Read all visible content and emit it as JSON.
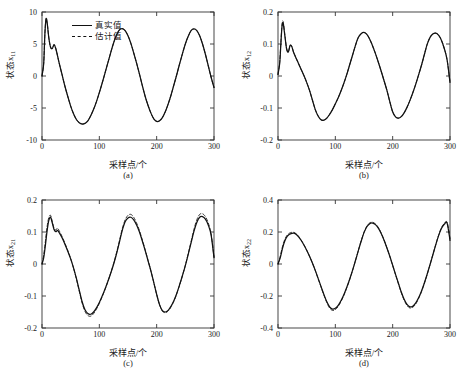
{
  "figure": {
    "background": "#ffffff",
    "line_color": "#111111"
  },
  "legend": {
    "position": "top-left of panel (a)",
    "entries": [
      {
        "label": "真实值",
        "style": "solid"
      },
      {
        "label": "估计值",
        "style": "dashed"
      }
    ]
  },
  "panels": [
    {
      "id": "a",
      "caption": "(a)",
      "ylabel_main": "状态x",
      "ylabel_sub": "11",
      "xlabel": "采样点/个",
      "yticks": [
        "10",
        "5",
        "0",
        "-5",
        "-10"
      ],
      "xticks": [
        "0",
        "100",
        "200",
        "300"
      ]
    },
    {
      "id": "b",
      "caption": "(b)",
      "ylabel_main": "状态x",
      "ylabel_sub": "12",
      "xlabel": "采样点/个",
      "yticks": [
        "0.2",
        "0.1",
        "0",
        "-0.1",
        "-0.2"
      ],
      "xticks": [
        "0",
        "100",
        "200",
        "300"
      ]
    },
    {
      "id": "c",
      "caption": "(c)",
      "ylabel_main": "状态x",
      "ylabel_sub": "21",
      "xlabel": "采样点/个",
      "yticks": [
        "0.2",
        "0.1",
        "0",
        "-0.1",
        "-0.2"
      ],
      "xticks": [
        "0",
        "100",
        "200",
        "300"
      ]
    },
    {
      "id": "d",
      "caption": "(d)",
      "ylabel_main": "状态x",
      "ylabel_sub": "22",
      "xlabel": "采样点/个",
      "yticks": [
        "0.4",
        "0.2",
        "0",
        "-0.2",
        "-0.4"
      ],
      "xticks": [
        "0",
        "100",
        "200",
        "300"
      ]
    }
  ],
  "chart_data": [
    {
      "type": "line",
      "panel": "a",
      "title": "",
      "xlabel": "采样点/个",
      "ylabel": "状态x11",
      "xlim": [
        0,
        300
      ],
      "ylim": [
        -10,
        10
      ],
      "grid": false,
      "legend": [
        "真实值",
        "估计值"
      ],
      "x": [
        0,
        3,
        5,
        7,
        9,
        12,
        15,
        18,
        21,
        24,
        27,
        30,
        35,
        40,
        45,
        50,
        55,
        60,
        65,
        70,
        75,
        80,
        85,
        90,
        95,
        100,
        105,
        110,
        115,
        120,
        125,
        130,
        135,
        140,
        145,
        150,
        155,
        160,
        165,
        170,
        175,
        180,
        185,
        190,
        195,
        200,
        205,
        210,
        215,
        220,
        225,
        230,
        235,
        240,
        245,
        250,
        255,
        260,
        265,
        270,
        275,
        280,
        285,
        290,
        295,
        300
      ],
      "series": [
        {
          "name": "真实值",
          "style": "solid",
          "values": [
            0.0,
            2.0,
            6.5,
            8.9,
            8.3,
            5.9,
            4.5,
            4.3,
            4.9,
            4.3,
            3.2,
            2.0,
            0.2,
            -1.6,
            -3.2,
            -4.7,
            -5.9,
            -6.8,
            -7.3,
            -7.5,
            -7.4,
            -7.0,
            -6.2,
            -5.2,
            -4.0,
            -2.6,
            -1.1,
            0.5,
            2.1,
            3.7,
            5.2,
            6.4,
            7.2,
            7.4,
            7.1,
            6.3,
            5.1,
            3.6,
            2.0,
            0.3,
            -1.5,
            -3.2,
            -4.6,
            -5.8,
            -6.7,
            -7.1,
            -7.0,
            -6.5,
            -5.6,
            -4.4,
            -3.0,
            -1.4,
            0.2,
            1.9,
            3.5,
            5.0,
            6.2,
            7.1,
            7.35,
            7.1,
            6.3,
            5.0,
            3.4,
            1.6,
            -0.2,
            -1.8
          ]
        },
        {
          "name": "估计值",
          "style": "dashed",
          "values": [
            0.0,
            2.1,
            6.6,
            8.9,
            8.3,
            5.9,
            4.5,
            4.3,
            4.9,
            4.3,
            3.2,
            2.0,
            0.2,
            -1.6,
            -3.2,
            -4.7,
            -5.9,
            -6.8,
            -7.3,
            -7.5,
            -7.4,
            -7.0,
            -6.2,
            -5.2,
            -4.0,
            -2.6,
            -1.1,
            0.5,
            2.1,
            3.7,
            5.2,
            6.4,
            7.2,
            7.4,
            7.1,
            6.3,
            5.1,
            3.6,
            2.0,
            0.3,
            -1.5,
            -3.2,
            -4.6,
            -5.8,
            -6.7,
            -7.1,
            -7.0,
            -6.5,
            -5.6,
            -4.4,
            -3.0,
            -1.4,
            0.2,
            1.9,
            3.5,
            5.0,
            6.2,
            7.1,
            7.35,
            7.1,
            6.3,
            5.0,
            3.4,
            1.6,
            -0.2,
            -1.8
          ]
        }
      ]
    },
    {
      "type": "line",
      "panel": "b",
      "title": "",
      "xlabel": "采样点/个",
      "ylabel": "状态x12",
      "xlim": [
        0,
        300
      ],
      "ylim": [
        -0.2,
        0.2
      ],
      "grid": false,
      "legend": [
        "真实值",
        "估计值"
      ],
      "x": [
        0,
        3,
        5,
        7,
        9,
        12,
        15,
        18,
        21,
        24,
        27,
        30,
        35,
        40,
        45,
        50,
        55,
        60,
        65,
        70,
        75,
        80,
        85,
        90,
        95,
        100,
        105,
        110,
        115,
        120,
        125,
        130,
        135,
        140,
        145,
        150,
        155,
        160,
        165,
        170,
        175,
        180,
        185,
        190,
        195,
        200,
        205,
        210,
        215,
        220,
        225,
        230,
        235,
        240,
        245,
        250,
        255,
        260,
        265,
        270,
        275,
        280,
        285,
        290,
        295,
        300
      ],
      "series": [
        {
          "name": "真实值",
          "style": "solid",
          "values": [
            0.005,
            0.04,
            0.1,
            0.155,
            0.165,
            0.125,
            0.085,
            0.075,
            0.095,
            0.092,
            0.075,
            0.062,
            0.042,
            0.022,
            0.002,
            -0.02,
            -0.045,
            -0.075,
            -0.105,
            -0.125,
            -0.137,
            -0.138,
            -0.132,
            -0.12,
            -0.105,
            -0.087,
            -0.068,
            -0.046,
            -0.022,
            0.005,
            0.035,
            0.065,
            0.095,
            0.12,
            0.132,
            0.136,
            0.13,
            0.115,
            0.094,
            0.07,
            0.043,
            0.015,
            -0.015,
            -0.045,
            -0.08,
            -0.112,
            -0.128,
            -0.132,
            -0.127,
            -0.115,
            -0.098,
            -0.077,
            -0.053,
            -0.027,
            0.002,
            0.032,
            0.065,
            0.098,
            0.12,
            0.131,
            0.134,
            0.128,
            0.112,
            0.086,
            0.05,
            -0.02
          ]
        },
        {
          "name": "估计值",
          "style": "dashed",
          "values": [
            0.005,
            0.045,
            0.105,
            0.16,
            0.17,
            0.128,
            0.086,
            0.075,
            0.095,
            0.092,
            0.075,
            0.062,
            0.042,
            0.022,
            0.002,
            -0.02,
            -0.045,
            -0.075,
            -0.105,
            -0.125,
            -0.137,
            -0.138,
            -0.132,
            -0.12,
            -0.105,
            -0.087,
            -0.068,
            -0.046,
            -0.022,
            0.005,
            0.035,
            0.065,
            0.095,
            0.12,
            0.132,
            0.136,
            0.13,
            0.115,
            0.094,
            0.07,
            0.043,
            0.015,
            -0.015,
            -0.045,
            -0.08,
            -0.112,
            -0.128,
            -0.132,
            -0.127,
            -0.115,
            -0.098,
            -0.077,
            -0.053,
            -0.027,
            0.002,
            0.032,
            0.065,
            0.098,
            0.12,
            0.131,
            0.134,
            0.128,
            0.112,
            0.086,
            0.05,
            -0.02
          ]
        }
      ]
    },
    {
      "type": "line",
      "panel": "c",
      "title": "",
      "xlabel": "采样点/个",
      "ylabel": "状态x21",
      "xlim": [
        0,
        300
      ],
      "ylim": [
        -0.2,
        0.2
      ],
      "grid": false,
      "legend": [
        "真实值",
        "估计值"
      ],
      "x": [
        0,
        3,
        6,
        9,
        12,
        15,
        18,
        21,
        24,
        27,
        30,
        35,
        40,
        45,
        50,
        55,
        60,
        65,
        70,
        75,
        80,
        85,
        90,
        95,
        100,
        105,
        110,
        115,
        120,
        125,
        130,
        135,
        140,
        145,
        150,
        155,
        160,
        165,
        170,
        175,
        180,
        185,
        190,
        195,
        200,
        205,
        210,
        215,
        220,
        225,
        230,
        235,
        240,
        245,
        250,
        255,
        260,
        265,
        270,
        275,
        280,
        285,
        290,
        295,
        300
      ],
      "series": [
        {
          "name": "真实值",
          "style": "solid",
          "values": [
            0.0,
            0.02,
            0.06,
            0.105,
            0.137,
            0.146,
            0.128,
            0.108,
            0.101,
            0.105,
            0.098,
            0.082,
            0.062,
            0.04,
            0.016,
            -0.012,
            -0.045,
            -0.082,
            -0.118,
            -0.143,
            -0.155,
            -0.157,
            -0.15,
            -0.137,
            -0.12,
            -0.1,
            -0.078,
            -0.054,
            -0.028,
            0.0,
            0.032,
            0.068,
            0.105,
            0.132,
            0.144,
            0.146,
            0.138,
            0.122,
            0.1,
            0.072,
            0.042,
            0.01,
            -0.022,
            -0.058,
            -0.095,
            -0.127,
            -0.146,
            -0.15,
            -0.145,
            -0.132,
            -0.115,
            -0.092,
            -0.065,
            -0.036,
            -0.005,
            0.03,
            0.066,
            0.102,
            0.13,
            0.146,
            0.148,
            0.14,
            0.122,
            0.09,
            0.02
          ]
        },
        {
          "name": "估计值",
          "style": "dashed",
          "values": [
            0.0,
            0.028,
            0.072,
            0.118,
            0.146,
            0.152,
            0.132,
            0.112,
            0.106,
            0.112,
            0.104,
            0.086,
            0.065,
            0.042,
            0.017,
            -0.013,
            -0.047,
            -0.085,
            -0.122,
            -0.148,
            -0.161,
            -0.163,
            -0.155,
            -0.141,
            -0.123,
            -0.102,
            -0.079,
            -0.054,
            -0.027,
            0.002,
            0.035,
            0.072,
            0.11,
            0.138,
            0.152,
            0.155,
            0.146,
            0.128,
            0.104,
            0.075,
            0.044,
            0.011,
            -0.022,
            -0.058,
            -0.095,
            -0.127,
            -0.147,
            -0.152,
            -0.147,
            -0.134,
            -0.116,
            -0.093,
            -0.066,
            -0.036,
            -0.004,
            0.032,
            0.07,
            0.108,
            0.138,
            0.155,
            0.157,
            0.148,
            0.128,
            0.094,
            0.022
          ]
        }
      ]
    },
    {
      "type": "line",
      "panel": "d",
      "title": "",
      "xlabel": "采样点/个",
      "ylabel": "状态x22",
      "xlim": [
        0,
        300
      ],
      "ylim": [
        -0.4,
        0.4
      ],
      "grid": false,
      "legend": [
        "真实值",
        "估计值"
      ],
      "x": [
        0,
        4,
        8,
        12,
        16,
        20,
        24,
        28,
        32,
        36,
        40,
        45,
        50,
        55,
        60,
        65,
        70,
        75,
        80,
        85,
        90,
        95,
        100,
        105,
        110,
        115,
        120,
        125,
        130,
        135,
        140,
        145,
        150,
        155,
        160,
        165,
        170,
        175,
        180,
        185,
        190,
        195,
        200,
        205,
        210,
        215,
        220,
        225,
        230,
        235,
        240,
        245,
        250,
        255,
        260,
        265,
        270,
        275,
        280,
        285,
        290,
        295,
        300
      ],
      "series": [
        {
          "name": "真实值",
          "style": "solid",
          "values": [
            0.0,
            0.04,
            0.1,
            0.145,
            0.172,
            0.186,
            0.192,
            0.193,
            0.185,
            0.17,
            0.15,
            0.12,
            0.086,
            0.048,
            0.006,
            -0.04,
            -0.09,
            -0.14,
            -0.19,
            -0.235,
            -0.268,
            -0.282,
            -0.277,
            -0.258,
            -0.228,
            -0.19,
            -0.145,
            -0.095,
            -0.04,
            0.02,
            0.082,
            0.142,
            0.196,
            0.233,
            0.252,
            0.256,
            0.246,
            0.224,
            0.19,
            0.148,
            0.1,
            0.048,
            -0.008,
            -0.065,
            -0.12,
            -0.175,
            -0.22,
            -0.252,
            -0.268,
            -0.264,
            -0.245,
            -0.213,
            -0.172,
            -0.122,
            -0.066,
            -0.006,
            0.056,
            0.118,
            0.176,
            0.222,
            0.248,
            0.255,
            0.148
          ]
        },
        {
          "name": "估计值",
          "style": "dashed",
          "values": [
            0.0,
            0.05,
            0.112,
            0.155,
            0.18,
            0.193,
            0.198,
            0.197,
            0.188,
            0.172,
            0.152,
            0.121,
            0.087,
            0.048,
            0.006,
            -0.041,
            -0.092,
            -0.143,
            -0.194,
            -0.24,
            -0.275,
            -0.29,
            -0.285,
            -0.265,
            -0.234,
            -0.195,
            -0.148,
            -0.097,
            -0.041,
            0.02,
            0.083,
            0.144,
            0.199,
            0.237,
            0.257,
            0.261,
            0.25,
            0.228,
            0.193,
            0.15,
            0.101,
            0.048,
            -0.009,
            -0.067,
            -0.123,
            -0.179,
            -0.226,
            -0.259,
            -0.275,
            -0.271,
            -0.251,
            -0.218,
            -0.176,
            -0.124,
            -0.067,
            -0.006,
            0.057,
            0.12,
            0.179,
            0.226,
            0.253,
            0.26,
            0.16
          ]
        }
      ]
    }
  ]
}
